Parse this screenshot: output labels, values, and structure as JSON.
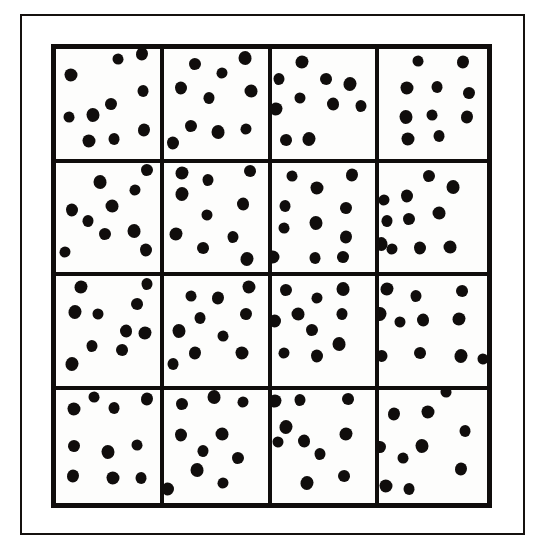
{
  "figure": {
    "kind": "quadrat-count-diagram",
    "grid_rows": 4,
    "grid_cols": 4,
    "total_quadrats": 16,
    "dot_color": "#100d0c",
    "line_color": "#100d0c",
    "background_color": "#ffffff",
    "frame_color": "#15110f"
  },
  "chart_data": {
    "type": "scatter",
    "title": "",
    "subtitle": "",
    "xlabel": "",
    "ylabel": "",
    "xlim": [
      0,
      4
    ],
    "ylim": [
      0,
      4
    ],
    "grid": true,
    "legend": "none",
    "annotations": [],
    "quadrat_rows": 4,
    "quadrat_cols": 4,
    "quadrat_counts": [
      [
        10,
        10,
        10,
        10
      ],
      [
        10,
        10,
        11,
        11
      ],
      [
        10,
        10,
        10,
        11
      ],
      [
        10,
        10,
        10,
        10
      ]
    ],
    "total_points": 163,
    "mean_count_per_quadrat": 10.2,
    "quadrats": [
      {
        "row": 1,
        "col": 1,
        "count": 10,
        "points": [
          [
            0.6,
            0.09
          ],
          [
            0.83,
            0.05
          ],
          [
            0.14,
            0.24
          ],
          [
            0.84,
            0.38
          ],
          [
            0.53,
            0.5
          ],
          [
            0.36,
            0.6
          ],
          [
            0.13,
            0.62
          ],
          [
            0.85,
            0.74
          ],
          [
            0.32,
            0.84
          ],
          [
            0.56,
            0.82
          ]
        ]
      },
      {
        "row": 1,
        "col": 2,
        "count": 10,
        "points": [
          [
            0.3,
            0.14
          ],
          [
            0.78,
            0.08
          ],
          [
            0.56,
            0.22
          ],
          [
            0.17,
            0.36
          ],
          [
            0.84,
            0.38
          ],
          [
            0.44,
            0.45
          ],
          [
            0.26,
            0.7
          ],
          [
            0.52,
            0.76
          ],
          [
            0.79,
            0.73
          ],
          [
            0.09,
            0.86
          ]
        ]
      },
      {
        "row": 1,
        "col": 3,
        "count": 10,
        "points": [
          [
            0.29,
            0.12
          ],
          [
            0.07,
            0.27
          ],
          [
            0.53,
            0.27
          ],
          [
            0.76,
            0.32
          ],
          [
            0.27,
            0.45
          ],
          [
            0.59,
            0.5
          ],
          [
            0.04,
            0.55
          ],
          [
            0.86,
            0.52
          ],
          [
            0.14,
            0.83
          ],
          [
            0.36,
            0.82
          ]
        ]
      },
      {
        "row": 1,
        "col": 4,
        "count": 10,
        "points": [
          [
            0.36,
            0.11
          ],
          [
            0.78,
            0.12
          ],
          [
            0.26,
            0.36
          ],
          [
            0.54,
            0.35
          ],
          [
            0.83,
            0.4
          ],
          [
            0.25,
            0.62
          ],
          [
            0.49,
            0.6
          ],
          [
            0.81,
            0.62
          ],
          [
            0.27,
            0.82
          ],
          [
            0.55,
            0.79
          ]
        ]
      },
      {
        "row": 2,
        "col": 1,
        "count": 10,
        "points": [
          [
            0.88,
            0.07
          ],
          [
            0.42,
            0.18
          ],
          [
            0.76,
            0.25
          ],
          [
            0.15,
            0.43
          ],
          [
            0.54,
            0.4
          ],
          [
            0.31,
            0.53
          ],
          [
            0.47,
            0.65
          ],
          [
            0.75,
            0.63
          ],
          [
            0.09,
            0.82
          ],
          [
            0.87,
            0.8
          ]
        ]
      },
      {
        "row": 2,
        "col": 2,
        "count": 10,
        "points": [
          [
            0.18,
            0.1
          ],
          [
            0.43,
            0.16
          ],
          [
            0.83,
            0.08
          ],
          [
            0.18,
            0.29
          ],
          [
            0.42,
            0.48
          ],
          [
            0.76,
            0.38
          ],
          [
            0.12,
            0.65
          ],
          [
            0.67,
            0.68
          ],
          [
            0.38,
            0.78
          ],
          [
            0.8,
            0.88
          ]
        ]
      },
      {
        "row": 2,
        "col": 3,
        "count": 11,
        "points": [
          [
            0.2,
            0.12
          ],
          [
            0.78,
            0.11
          ],
          [
            0.44,
            0.23
          ],
          [
            0.13,
            0.4
          ],
          [
            0.72,
            0.42
          ],
          [
            0.43,
            0.55
          ],
          [
            0.12,
            0.6
          ],
          [
            0.72,
            0.68
          ],
          [
            0.01,
            0.86
          ],
          [
            0.42,
            0.87
          ],
          [
            0.69,
            0.86
          ]
        ]
      },
      {
        "row": 2,
        "col": 4,
        "count": 11,
        "points": [
          [
            0.46,
            0.12
          ],
          [
            0.68,
            0.22
          ],
          [
            0.04,
            0.34
          ],
          [
            0.26,
            0.31
          ],
          [
            0.55,
            0.46
          ],
          [
            0.07,
            0.53
          ],
          [
            0.28,
            0.52
          ],
          [
            0.02,
            0.74
          ],
          [
            0.12,
            0.79
          ],
          [
            0.38,
            0.78
          ],
          [
            0.66,
            0.77
          ]
        ]
      },
      {
        "row": 3,
        "col": 1,
        "count": 10,
        "points": [
          [
            0.24,
            0.1
          ],
          [
            0.88,
            0.07
          ],
          [
            0.78,
            0.26
          ],
          [
            0.18,
            0.33
          ],
          [
            0.4,
            0.35
          ],
          [
            0.67,
            0.5
          ],
          [
            0.86,
            0.52
          ],
          [
            0.35,
            0.64
          ],
          [
            0.64,
            0.68
          ],
          [
            0.15,
            0.8
          ]
        ]
      },
      {
        "row": 3,
        "col": 2,
        "count": 10,
        "points": [
          [
            0.26,
            0.18
          ],
          [
            0.52,
            0.2
          ],
          [
            0.82,
            0.1
          ],
          [
            0.35,
            0.38
          ],
          [
            0.79,
            0.35
          ],
          [
            0.15,
            0.5
          ],
          [
            0.57,
            0.55
          ],
          [
            0.3,
            0.7
          ],
          [
            0.75,
            0.7
          ],
          [
            0.09,
            0.8
          ]
        ]
      },
      {
        "row": 3,
        "col": 3,
        "count": 10,
        "points": [
          [
            0.14,
            0.13
          ],
          [
            0.69,
            0.12
          ],
          [
            0.44,
            0.2
          ],
          [
            0.03,
            0.41
          ],
          [
            0.26,
            0.35
          ],
          [
            0.68,
            0.35
          ],
          [
            0.39,
            0.49
          ],
          [
            0.65,
            0.62
          ],
          [
            0.12,
            0.7
          ],
          [
            0.44,
            0.73
          ]
        ]
      },
      {
        "row": 3,
        "col": 4,
        "count": 11,
        "points": [
          [
            0.07,
            0.12
          ],
          [
            0.34,
            0.18
          ],
          [
            0.77,
            0.14
          ],
          [
            0.01,
            0.35
          ],
          [
            0.19,
            0.42
          ],
          [
            0.41,
            0.4
          ],
          [
            0.74,
            0.39
          ],
          [
            0.03,
            0.73
          ],
          [
            0.38,
            0.7
          ],
          [
            0.76,
            0.73
          ],
          [
            0.96,
            0.76
          ]
        ]
      },
      {
        "row": 4,
        "col": 1,
        "count": 10,
        "points": [
          [
            0.37,
            0.07
          ],
          [
            0.88,
            0.08
          ],
          [
            0.17,
            0.17
          ],
          [
            0.56,
            0.16
          ],
          [
            0.17,
            0.5
          ],
          [
            0.5,
            0.55
          ],
          [
            0.78,
            0.49
          ],
          [
            0.16,
            0.76
          ],
          [
            0.55,
            0.78
          ],
          [
            0.82,
            0.78
          ]
        ]
      },
      {
        "row": 4,
        "col": 2,
        "count": 10,
        "points": [
          [
            0.18,
            0.13
          ],
          [
            0.48,
            0.07
          ],
          [
            0.76,
            0.11
          ],
          [
            0.17,
            0.4
          ],
          [
            0.56,
            0.39
          ],
          [
            0.38,
            0.54
          ],
          [
            0.72,
            0.6
          ],
          [
            0.32,
            0.71
          ],
          [
            0.57,
            0.82
          ],
          [
            0.04,
            0.88
          ]
        ]
      },
      {
        "row": 4,
        "col": 3,
        "count": 10,
        "points": [
          [
            0.03,
            0.1
          ],
          [
            0.27,
            0.09
          ],
          [
            0.74,
            0.08
          ],
          [
            0.14,
            0.33
          ],
          [
            0.06,
            0.46
          ],
          [
            0.31,
            0.45
          ],
          [
            0.72,
            0.39
          ],
          [
            0.47,
            0.57
          ],
          [
            0.7,
            0.76
          ],
          [
            0.34,
            0.82
          ]
        ]
      },
      {
        "row": 4,
        "col": 4,
        "count": 10,
        "points": [
          [
            0.62,
            0.02
          ],
          [
            0.14,
            0.22
          ],
          [
            0.45,
            0.2
          ],
          [
            0.8,
            0.37
          ],
          [
            0.01,
            0.51
          ],
          [
            0.4,
            0.5
          ],
          [
            0.22,
            0.6
          ],
          [
            0.76,
            0.7
          ],
          [
            0.06,
            0.85
          ],
          [
            0.28,
            0.88
          ]
        ]
      }
    ]
  }
}
